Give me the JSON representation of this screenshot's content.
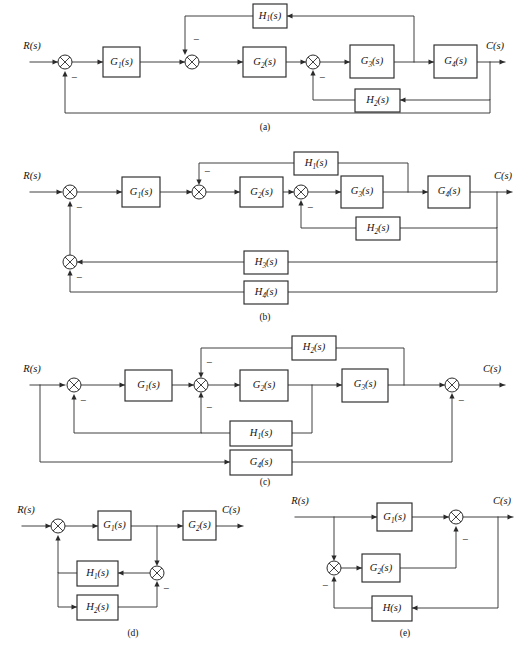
{
  "figure": {
    "background_color": "#ffffff",
    "line_color": "#2b2b2b",
    "captions": [
      {
        "id": "cap-a",
        "text": "(a)"
      },
      {
        "id": "cap-b",
        "text": "(b)"
      },
      {
        "id": "cap-c",
        "text": "(c)"
      },
      {
        "id": "cap-d",
        "text": "(d)"
      },
      {
        "id": "cap-e",
        "text": "(e)"
      }
    ],
    "signs": {
      "minus": "−"
    },
    "io": {
      "input": "R(s)",
      "output": "C(s)"
    }
  },
  "diagrams": {
    "a": {
      "caption": "(a)",
      "input_label": "R(s)",
      "output_label": "C(s)",
      "blocks": [
        {
          "name": "G1",
          "base": "G",
          "sub": "1",
          "arg": "(s)",
          "label": "G₁(s)"
        },
        {
          "name": "G2",
          "base": "G",
          "sub": "2",
          "arg": "(s)",
          "label": "G₂(s)"
        },
        {
          "name": "G3",
          "base": "G",
          "sub": "3",
          "arg": "(s)",
          "label": "G₃(s)"
        },
        {
          "name": "G4",
          "base": "G",
          "sub": "4",
          "arg": "(s)",
          "label": "G₄(s)"
        },
        {
          "name": "H1",
          "base": "H",
          "sub": "1",
          "arg": "(s)",
          "label": "H₁(s)"
        },
        {
          "name": "H2",
          "base": "H",
          "sub": "2",
          "arg": "(s)",
          "label": "H₂(s)"
        }
      ],
      "summing_junctions": 3,
      "minus_signs": 3
    },
    "b": {
      "caption": "(b)",
      "input_label": "R(s)",
      "output_label": "C(s)",
      "blocks": [
        {
          "name": "G1",
          "base": "G",
          "sub": "1",
          "arg": "(s)",
          "label": "G₁(s)"
        },
        {
          "name": "G2",
          "base": "G",
          "sub": "2",
          "arg": "(s)",
          "label": "G₂(s)"
        },
        {
          "name": "G3",
          "base": "G",
          "sub": "3",
          "arg": "(s)",
          "label": "G₃(s)"
        },
        {
          "name": "G4",
          "base": "G",
          "sub": "4",
          "arg": "(s)",
          "label": "G₄(s)"
        },
        {
          "name": "H1",
          "base": "H",
          "sub": "1",
          "arg": "(s)",
          "label": "H₁(s)"
        },
        {
          "name": "H2",
          "base": "H",
          "sub": "2",
          "arg": "(s)",
          "label": "H₂(s)"
        },
        {
          "name": "H3",
          "base": "H",
          "sub": "3",
          "arg": "(s)",
          "label": "H₃(s)"
        },
        {
          "name": "H4",
          "base": "H",
          "sub": "4",
          "arg": "(s)",
          "label": "H₄(s)"
        }
      ],
      "summing_junctions": 4,
      "minus_signs": 4
    },
    "c": {
      "caption": "(c)",
      "input_label": "R(s)",
      "output_label": "C(s)",
      "blocks": [
        {
          "name": "G1",
          "base": "G",
          "sub": "1",
          "arg": "(s)",
          "label": "G₁(s)"
        },
        {
          "name": "G2",
          "base": "G",
          "sub": "2",
          "arg": "(s)",
          "label": "G₂(s)"
        },
        {
          "name": "G3",
          "base": "G",
          "sub": "3",
          "arg": "(s)",
          "label": "G₃(s)"
        },
        {
          "name": "G4",
          "base": "G",
          "sub": "4",
          "arg": "(s)",
          "label": "G₄(s)"
        },
        {
          "name": "H1",
          "base": "H",
          "sub": "1",
          "arg": "(s)",
          "label": "H₁(s)"
        },
        {
          "name": "H2",
          "base": "H",
          "sub": "2",
          "arg": "(s)",
          "label": "H₂(s)"
        }
      ],
      "summing_junctions": 3,
      "minus_signs": 4
    },
    "d": {
      "caption": "(d)",
      "input_label": "R(s)",
      "output_label": "C(s)",
      "blocks": [
        {
          "name": "G1",
          "base": "G",
          "sub": "1",
          "arg": "(s)",
          "label": "G₁(s)"
        },
        {
          "name": "G2",
          "base": "G",
          "sub": "2",
          "arg": "(s)",
          "label": "G₂(s)"
        },
        {
          "name": "H1",
          "base": "H",
          "sub": "1",
          "arg": "(s)",
          "label": "H₁(s)"
        },
        {
          "name": "H2",
          "base": "H",
          "sub": "2",
          "arg": "(s)",
          "label": "H₂(s)"
        }
      ],
      "summing_junctions": 2,
      "minus_signs": 1
    },
    "e": {
      "caption": "(e)",
      "input_label": "R(s)",
      "output_label": "C(s)",
      "blocks": [
        {
          "name": "G1",
          "base": "G",
          "sub": "1",
          "arg": "(s)",
          "label": "G₁(s)"
        },
        {
          "name": "G2",
          "base": "G",
          "sub": "2",
          "arg": "(s)",
          "label": "G₂(s)"
        },
        {
          "name": "H",
          "base": "H",
          "sub": "",
          "arg": "(s)",
          "label": "H(s)"
        }
      ],
      "summing_junctions": 2,
      "minus_signs": 2
    }
  },
  "labels": {
    "R": "R(s)",
    "C": "C(s)",
    "minus": "−",
    "G1": "G",
    "G1sub": "1",
    "G1arg": "(s)",
    "G2": "G",
    "G2sub": "2",
    "G2arg": "(s)",
    "G3": "G",
    "G3sub": "3",
    "G3arg": "(s)",
    "G4": "G",
    "G4sub": "4",
    "G4arg": "(s)",
    "H1": "H",
    "H1sub": "1",
    "H1arg": "(s)",
    "H2": "H",
    "H2sub": "2",
    "H2arg": "(s)",
    "H3": "H",
    "H3sub": "3",
    "H3arg": "(s)",
    "H4": "H",
    "H4sub": "4",
    "H4arg": "(s)",
    "H": "H",
    "Harg": "(s)",
    "capA": "(a)",
    "capB": "(b)",
    "capC": "(c)",
    "capD": "(d)",
    "capE": "(e)"
  }
}
